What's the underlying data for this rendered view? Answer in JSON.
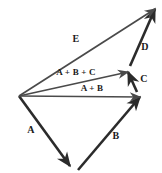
{
  "figure": {
    "kind": "vector-addition-diagram",
    "width": 162,
    "height": 173,
    "background_color": "#ffffff",
    "stroke_color_dark": "#2b2b2b",
    "stroke_color_mid": "#555555",
    "label_color": "#1a1a1a"
  },
  "labels": {
    "a": "A",
    "b": "B",
    "c": "C",
    "d": "D",
    "e": "E",
    "a_plus_b": "A + B",
    "a_plus_b_plus_c": "A + B + C"
  },
  "chart_data": {
    "type": "scatter",
    "title": "",
    "xlabel": "",
    "ylabel": "",
    "xlim": [
      0,
      162
    ],
    "ylim": [
      173,
      0
    ],
    "grid": false,
    "legend": "none",
    "note": "Head-to-tail vector addition: A + B + C + D = E, drawn from a common origin at (19, 96).",
    "vectors": [
      {
        "name": "A",
        "label": "A",
        "tail": [
          19,
          96
        ],
        "head": [
          70,
          166
        ],
        "label_pos": [
          31,
          130
        ],
        "weight": "heavy"
      },
      {
        "name": "B",
        "label": "B",
        "tail": [
          78,
          170
        ],
        "head": [
          140,
          97
        ],
        "label_pos": [
          116,
          136
        ],
        "weight": "heavy"
      },
      {
        "name": "C",
        "label": "C",
        "tail": [
          137,
          92
        ],
        "head": [
          128,
          72
        ],
        "label_pos": [
          144,
          79
        ],
        "weight": "heavy"
      },
      {
        "name": "D",
        "label": "D",
        "tail": [
          130,
          66
        ],
        "head": [
          155,
          9
        ],
        "label_pos": [
          145,
          47
        ],
        "weight": "heavy"
      },
      {
        "name": "A+B",
        "label": "A + B",
        "tail": [
          19,
          96
        ],
        "head": [
          140,
          97
        ],
        "label_pos": [
          92,
          88
        ],
        "weight": "light"
      },
      {
        "name": "A+B+C",
        "label": "A + B + C",
        "tail": [
          19,
          96
        ],
        "head": [
          128,
          72
        ],
        "label_pos": [
          76,
          72
        ],
        "weight": "light"
      },
      {
        "name": "E",
        "label": "E",
        "tail": [
          19,
          96
        ],
        "head": [
          155,
          9
        ],
        "label_pos": [
          76,
          39
        ],
        "weight": "light"
      }
    ],
    "origin": [
      19,
      96
    ]
  }
}
